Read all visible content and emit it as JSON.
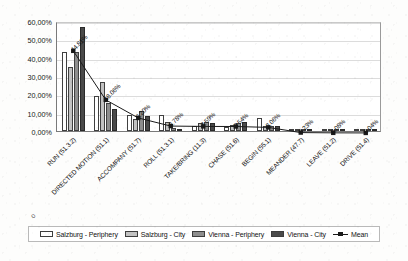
{
  "chart_data": {
    "type": "bar",
    "title": "",
    "xlabel": "",
    "ylabel": "",
    "ylim": [
      0,
      60
    ],
    "ytick_labels": [
      "60,00%",
      "50,00%",
      "40,00%",
      "30,00%",
      "20,00%",
      "10,00%",
      "0,00%"
    ],
    "ytick_values": [
      60,
      50,
      40,
      30,
      20,
      10,
      0
    ],
    "grid": true,
    "legend_position": "bottom",
    "categories": [
      "RUN (51.3.2)",
      "DIRECTED MOTION (51.1)",
      "ACCOMPANY (51.7)",
      "ROLL (51.3.1)",
      "TAKE/BRING (11.3)",
      "CHASE (51.6)",
      "BEGIN (55.1)",
      "MEANDER (47.7)",
      "LEAVE (51.2)",
      "DRIVE (51.4)"
    ],
    "series": [
      {
        "name": "Salzburg - Periphery",
        "color": "#ffffff",
        "values": [
          43.0,
          19.0,
          8.5,
          9.0,
          3.0,
          2.0,
          7.0,
          0.3,
          0.1,
          0.05
        ]
      },
      {
        "name": "Salzburg - City",
        "color": "#c2c2c2",
        "values": [
          35.0,
          27.0,
          6.5,
          5.0,
          4.5,
          3.5,
          3.0,
          0.3,
          0.1,
          0.05
        ]
      },
      {
        "name": "Vienna - Periphery",
        "color": "#8e8e8e",
        "values": [
          43.0,
          15.5,
          11.0,
          1.5,
          5.0,
          4.5,
          2.5,
          0.2,
          0.05,
          0.03
        ]
      },
      {
        "name": "Vienna - City",
        "color": "#4a4a4a",
        "values": [
          57.0,
          12.0,
          8.0,
          0.3,
          4.5,
          5.0,
          2.5,
          0.2,
          0.05,
          0.03
        ]
      }
    ],
    "mean_series": {
      "name": "Mean",
      "color": "#1a1a1a",
      "marker": "square",
      "values": [
        44.81,
        18.06,
        8.2,
        3.78,
        3.59,
        3.54,
        3.06,
        0.23,
        0.08,
        0.04
      ],
      "labels": [
        "44.81%",
        "18.06%",
        "8.20%",
        "3.78%",
        "3.59%",
        "3.54%",
        "3.06%",
        "0.23%",
        "0.08%",
        "0.04%"
      ]
    }
  },
  "legend": {
    "items": [
      {
        "label": "Salzburg - Periphery",
        "swatch": "#ffffff"
      },
      {
        "label": "Salzburg - City",
        "swatch": "#c2c2c2"
      },
      {
        "label": "Vienna - Periphery",
        "swatch": "#8e8e8e"
      },
      {
        "label": "Vienna - City",
        "swatch": "#4a4a4a"
      },
      {
        "label": "Mean",
        "swatch": "line-marker"
      }
    ]
  }
}
